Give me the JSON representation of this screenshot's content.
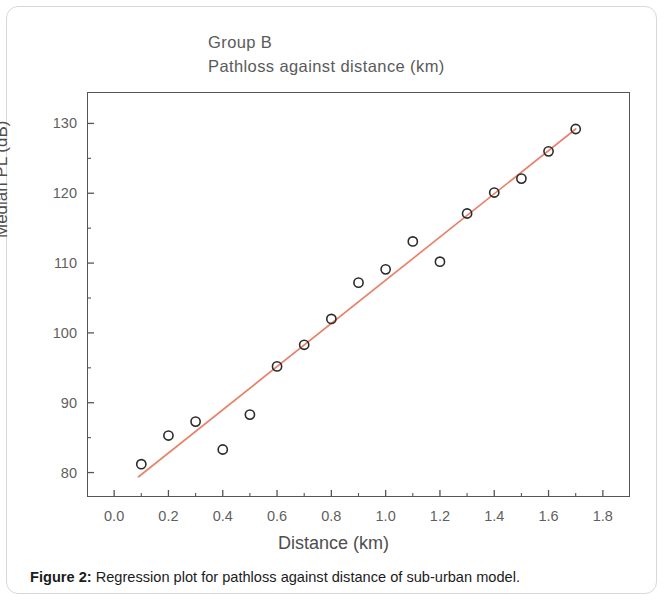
{
  "figure": {
    "caption_label": "Figure 2:",
    "caption_text": " Regression plot for pathloss against distance of sub-urban model."
  },
  "chart_data": {
    "type": "scatter",
    "title": "Group B\nPathloss against distance (km)",
    "title_line1": "Group B",
    "title_line2": "Pathloss against distance (km)",
    "xlabel": "Distance (km)",
    "ylabel": "Median PL (dB)",
    "xlim": [
      -0.1,
      1.9
    ],
    "ylim": [
      76.5,
      134.5
    ],
    "xticks": [
      0.0,
      0.2,
      0.4,
      0.6,
      0.8,
      1.0,
      1.2,
      1.4,
      1.6,
      1.8
    ],
    "xtick_labels": [
      "0.0",
      "0.2",
      "0.4",
      "0.6",
      "0.8",
      "1.0",
      "1.2",
      "1.4",
      "1.6",
      "1.8"
    ],
    "yticks": [
      80,
      90,
      100,
      110,
      120,
      130
    ],
    "ytick_labels": [
      "80",
      "90",
      "100",
      "110",
      "120",
      "130"
    ],
    "x_minor_ticks": [
      0.1,
      0.3,
      0.5,
      0.7,
      0.9,
      1.1,
      1.3,
      1.5,
      1.7
    ],
    "y_minor_ticks": [
      85,
      95,
      105,
      115,
      125
    ],
    "grid": false,
    "legend": false,
    "marker_style": "open-circle",
    "marker_color": "#2b2b2b",
    "line_color": "#e8836b",
    "series": [
      {
        "name": "Median PL (dB)",
        "x": [
          0.1,
          0.2,
          0.3,
          0.4,
          0.5,
          0.6,
          0.7,
          0.8,
          0.9,
          1.0,
          1.1,
          1.2,
          1.3,
          1.4,
          1.5,
          1.6,
          1.7
        ],
        "y": [
          81.2,
          85.3,
          87.3,
          83.3,
          88.3,
          95.2,
          98.3,
          102.0,
          107.2,
          109.1,
          113.1,
          110.2,
          117.1,
          120.1,
          122.1,
          126.0,
          129.2
        ]
      }
    ],
    "fit_line": {
      "name": "regression line",
      "x": [
        0.09,
        1.7
      ],
      "y": [
        79.4,
        129.2
      ]
    }
  }
}
